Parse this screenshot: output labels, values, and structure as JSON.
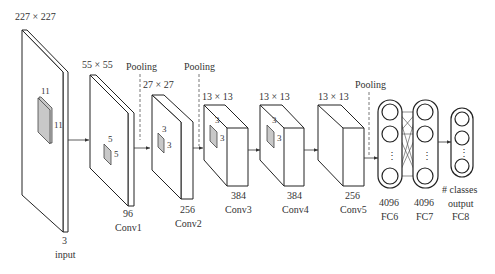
{
  "input": {
    "size": "227 × 227",
    "channels": "3",
    "name": "input",
    "kernel_h": "11",
    "kernel_w": "11"
  },
  "layers": [
    {
      "id": "conv1",
      "size": "55 × 55",
      "channels": "96",
      "name": "Conv1",
      "kernel_h": "5",
      "kernel_w": "5"
    },
    {
      "id": "conv2",
      "size": "27 × 27",
      "channels": "256",
      "name": "Conv2",
      "kernel_h": "3",
      "kernel_w": "3"
    },
    {
      "id": "conv3",
      "size": "13 × 13",
      "channels": "384",
      "name": "Conv3",
      "kernel_h": "3",
      "kernel_w": "3"
    },
    {
      "id": "conv4",
      "size": "13 × 13",
      "channels": "384",
      "name": "Conv4",
      "kernel_h": "3",
      "kernel_w": "3"
    },
    {
      "id": "conv5",
      "size": "13 × 13",
      "channels": "256",
      "name": "Conv5"
    }
  ],
  "pooling": [
    "Pooling",
    "Pooling",
    "Pooling"
  ],
  "fc": [
    {
      "id": "fc6",
      "units": "4096",
      "name": "FC6"
    },
    {
      "id": "fc7",
      "units": "4096",
      "name": "FC7"
    },
    {
      "id": "fc8",
      "units_line1": "# classes",
      "units_line2": "output",
      "name": "FC8"
    }
  ],
  "ellipsis": "⋮"
}
